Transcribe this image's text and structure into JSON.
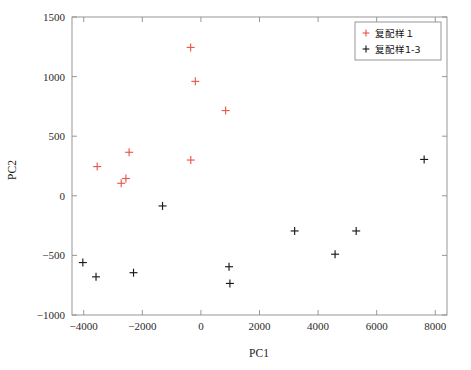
{
  "figure": {
    "background_color": "#ffffff",
    "frame_color": "#8c8c8c"
  },
  "chart_data": {
    "type": "scatter",
    "title": "",
    "xlabel": "PC1",
    "ylabel": "PC2",
    "xlim": [
      -4400,
      8400
    ],
    "ylim": [
      -1000,
      1500
    ],
    "xticks": [
      -4000,
      -2000,
      0,
      2000,
      4000,
      6000,
      8000
    ],
    "xtick_labels": [
      "−4000",
      "−2000",
      "0",
      "2000",
      "4000",
      "6000",
      "8000"
    ],
    "yticks": [
      -1000,
      -500,
      0,
      500,
      1000,
      1500
    ],
    "ytick_labels": [
      "−1000",
      "−500",
      "0",
      "500",
      "1000",
      "1500"
    ],
    "grid": false,
    "marker": "plus",
    "legend_position": "upper-right",
    "series": [
      {
        "name": "复配样１",
        "color": "#e8594a",
        "marker": "+",
        "points": [
          {
            "x": -3540,
            "y": 245
          },
          {
            "x": -2720,
            "y": 105
          },
          {
            "x": -2560,
            "y": 145
          },
          {
            "x": -2450,
            "y": 365
          },
          {
            "x": -350,
            "y": 1245
          },
          {
            "x": -190,
            "y": 960
          },
          {
            "x": -345,
            "y": 300
          },
          {
            "x": 845,
            "y": 715
          }
        ]
      },
      {
        "name": "复配样1-3",
        "color": "#1a1a1a",
        "marker": "+",
        "points": [
          {
            "x": -4030,
            "y": -560
          },
          {
            "x": -3580,
            "y": -680
          },
          {
            "x": -2300,
            "y": -645
          },
          {
            "x": -1310,
            "y": -85
          },
          {
            "x": 960,
            "y": -595
          },
          {
            "x": 990,
            "y": -735
          },
          {
            "x": 3200,
            "y": -295
          },
          {
            "x": 4580,
            "y": -490
          },
          {
            "x": 5300,
            "y": -295
          },
          {
            "x": 7620,
            "y": 305
          }
        ]
      }
    ]
  },
  "legend": {
    "entries": [
      {
        "label": "复配样１",
        "color": "#e8594a"
      },
      {
        "label": "复配样1-3",
        "color": "#1a1a1a"
      }
    ]
  }
}
